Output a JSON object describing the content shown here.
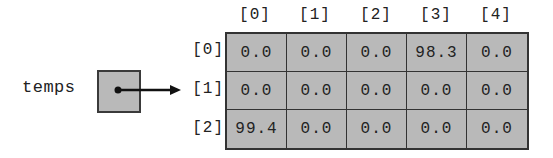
{
  "variable": {
    "name": "temps"
  },
  "array": {
    "column_headers": [
      "[0]",
      "[1]",
      "[2]",
      "[3]",
      "[4]"
    ],
    "row_headers": [
      "[0]",
      "[1]",
      "[2]"
    ],
    "rows": [
      [
        "0.0",
        "0.0",
        "0.0",
        "98.3",
        "0.0"
      ],
      [
        "0.0",
        "0.0",
        "0.0",
        "0.0",
        "0.0"
      ],
      [
        "99.4",
        "0.0",
        "0.0",
        "0.0",
        "0.0"
      ]
    ]
  },
  "colors": {
    "cell_fill": "#b9b9b9",
    "border": "#333333",
    "text": "#222222"
  }
}
